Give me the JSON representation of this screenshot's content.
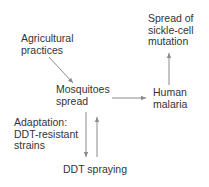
{
  "diagram": {
    "nodes": [
      {
        "id": "agricultural-practices",
        "lines": [
          "Agricultural",
          "practices"
        ]
      },
      {
        "id": "mosquitoes-spread",
        "lines": [
          "Mosquitoes",
          "spread"
        ]
      },
      {
        "id": "human-malaria",
        "lines": [
          "Human",
          "malaria"
        ]
      },
      {
        "id": "sickle-cell",
        "lines": [
          "Spread of",
          "sickle-cell",
          "mutation"
        ]
      },
      {
        "id": "adaptation",
        "lines": [
          "Adaptation:",
          "DDT-resistant",
          "strains"
        ]
      },
      {
        "id": "ddt-spraying",
        "lines": [
          "DDT spraying"
        ]
      }
    ],
    "edges": [
      {
        "from": "agricultural-practices",
        "to": "mosquitoes-spread"
      },
      {
        "from": "mosquitoes-spread",
        "to": "human-malaria"
      },
      {
        "from": "human-malaria",
        "to": "sickle-cell"
      },
      {
        "from": "mosquitoes-spread",
        "to": "ddt-spraying"
      },
      {
        "from": "ddt-spraying",
        "to": "mosquitoes-spread"
      }
    ],
    "colors": {
      "text": "#333333",
      "arrow": "#8a8a8a",
      "background": "#ffffff"
    }
  }
}
